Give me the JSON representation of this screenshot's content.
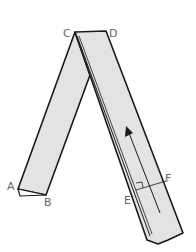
{
  "diagram": {
    "labels": {
      "A": "A",
      "B": "B",
      "C": "C",
      "D": "D",
      "E": "E",
      "F": "F"
    },
    "colors": {
      "strip_fill": "#e3e3e3",
      "stroke": "#1a1a1a",
      "label": "#666666"
    }
  }
}
